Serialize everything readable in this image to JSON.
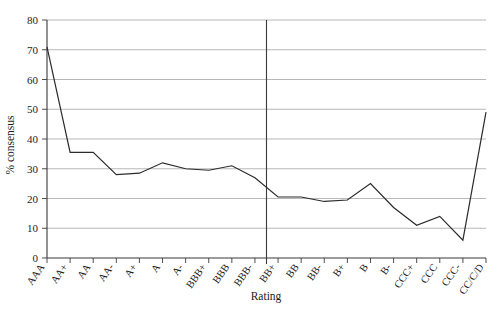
{
  "chart_data": {
    "type": "line",
    "title": "",
    "xlabel": "Rating",
    "ylabel": "% consensus",
    "ylim": [
      0,
      80
    ],
    "ytick_values": [
      0,
      10,
      20,
      30,
      40,
      50,
      60,
      70,
      80
    ],
    "ytick_labels": [
      "0",
      "10",
      "20",
      "30",
      "40",
      "50",
      "60",
      "70",
      "80"
    ],
    "grid": true,
    "legend": "none",
    "categories": [
      "AAA",
      "AA+",
      "AA",
      "AA-",
      "A+",
      "A",
      "A-",
      "BBB+",
      "BBB",
      "BBB-",
      "BB+",
      "BB",
      "BB-",
      "B+",
      "B",
      "B-",
      "CCC+",
      "CCC",
      "CCC-",
      "CC/C/D"
    ],
    "values": [
      71,
      35.5,
      35.5,
      28,
      28.5,
      32,
      30,
      29.5,
      31,
      27,
      20.5,
      20.5,
      19,
      19.5,
      25,
      17,
      11,
      14,
      6,
      49
    ],
    "series": [
      {
        "name": "% consensus",
        "values": [
          71,
          35.5,
          35.5,
          28,
          28.5,
          32,
          30,
          29.5,
          31,
          27,
          20.5,
          20.5,
          19,
          19.5,
          25,
          17,
          11,
          14,
          6,
          49
        ],
        "color": "#2b2b2b"
      }
    ],
    "annotations": [
      {
        "name": "investment-speculative-divider",
        "type": "vertical-line",
        "between": [
          "BBB-",
          "BB+"
        ]
      }
    ]
  },
  "axes": {
    "y_title": "% consensus",
    "x_title": "Rating"
  }
}
